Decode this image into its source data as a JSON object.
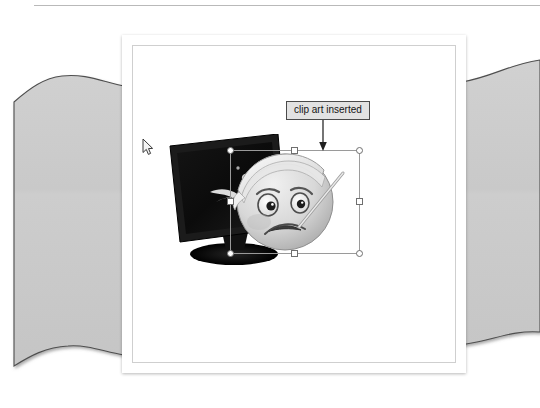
{
  "scene": {
    "kind": "presentation-slide-screenshot",
    "background_color": "#ffffff",
    "paper_color": "#cbcbcb",
    "card_color": "#ffffff",
    "accent_border_color": "#cfcfcf"
  },
  "top_rule": {
    "name": "top-divider-rule",
    "color": "#b9b9b9"
  },
  "paper": {
    "name": "torn-paper-background",
    "fill": "#cbcbcb",
    "edge_color": "#4f4f4f",
    "description": "grey textured sheet with wavy torn top and bottom edges"
  },
  "card": {
    "name": "slide-canvas",
    "inner_border_color": "#cfcfcf",
    "description": "white slide page with thin grey inner frame"
  },
  "monitor": {
    "name": "lcd-monitor-clipart",
    "screen_color": "#0d0d0d",
    "bezel_color": "#1a1a1a",
    "label": "tilted black flat-panel monitor with stand"
  },
  "clipart": {
    "name": "injured-smiley-face-clipart",
    "label": "grayscale cartoon face with head bandage and thermometer",
    "face_color": "#d6d6d6",
    "bandage_color": "#efefef"
  },
  "callout": {
    "name": "annotation-callout",
    "text": "clip art inserted",
    "background": "#e2e2e2",
    "border_color": "#4a4a4a",
    "arrow_color": "#2a2a2a",
    "arrow_direction": "down"
  },
  "selection": {
    "name": "image-selection-frame",
    "border_color": "#9a9a9a",
    "handle_fill": "#ffffff",
    "handle_stroke": "#6f6f6f",
    "handle_count": 8,
    "handles": [
      {
        "position": "top-left",
        "shape": "circle"
      },
      {
        "position": "top-middle",
        "shape": "square"
      },
      {
        "position": "top-right",
        "shape": "circle"
      },
      {
        "position": "middle-left",
        "shape": "square"
      },
      {
        "position": "middle-right",
        "shape": "square"
      },
      {
        "position": "bottom-left",
        "shape": "circle"
      },
      {
        "position": "bottom-middle",
        "shape": "square"
      },
      {
        "position": "bottom-right",
        "shape": "circle"
      }
    ]
  },
  "cursor": {
    "name": "mouse-pointer",
    "shape": "arrow",
    "fill": "#f2f2f2",
    "stroke": "#3a3a3a"
  }
}
